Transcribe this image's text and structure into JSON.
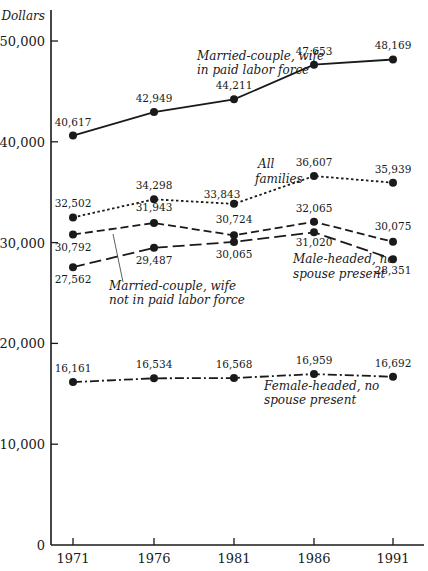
{
  "chart_data": {
    "type": "line",
    "title": "",
    "xlabel": "",
    "ylabel": "Dollars",
    "ylim": [
      0,
      52000
    ],
    "yticks": [
      0,
      10000,
      20000,
      30000,
      40000,
      50000
    ],
    "ytick_labels": [
      "0",
      "10,000",
      "20,000",
      "30,000",
      "40,000",
      "50,000"
    ],
    "categories": [
      "1971",
      "1976",
      "1981",
      "1986",
      "1991"
    ],
    "grid": false,
    "legend": "inline labels",
    "series": [
      {
        "name": "Married-couple, wife in paid labor force",
        "style": "solid",
        "values": [
          40617,
          42949,
          44211,
          47653,
          48169
        ],
        "labels": [
          "40,617",
          "42,949",
          "44,211",
          "47,653",
          "48,169"
        ]
      },
      {
        "name": "All families",
        "style": "dotted",
        "values": [
          32502,
          34298,
          33843,
          36607,
          35939
        ],
        "labels": [
          "32,502",
          "34,298",
          "33,843",
          "36,607",
          "35,939"
        ]
      },
      {
        "name": "Married-couple, wife not in paid labor force",
        "style": "dashed",
        "values": [
          30792,
          31943,
          30724,
          32065,
          30075
        ],
        "labels": [
          "30,792",
          "31,943",
          "30,724",
          "32,065",
          "30,075"
        ]
      },
      {
        "name": "Male-headed, no spouse present",
        "style": "long-dash",
        "values": [
          27562,
          29487,
          30065,
          31020,
          28351
        ],
        "labels": [
          "27,562",
          "29,487",
          "30,065",
          "31,020",
          "28,351"
        ]
      },
      {
        "name": "Female-headed, no spouse present",
        "style": "dash-dot",
        "values": [
          16161,
          16534,
          16568,
          16959,
          16692
        ],
        "labels": [
          "16,161",
          "16,534",
          "16,568",
          "16,959",
          "16,692"
        ]
      }
    ],
    "annotations": [
      {
        "series": 0,
        "lines": [
          "Married-couple, wife",
          "in paid labor force"
        ]
      },
      {
        "series": 1,
        "lines": [
          "All",
          "families"
        ]
      },
      {
        "series": 2,
        "lines": [
          "Married-couple, wife",
          "not in paid labor force"
        ]
      },
      {
        "series": 3,
        "lines": [
          "Male-headed, no",
          "spouse present"
        ]
      },
      {
        "series": 4,
        "lines": [
          "Female-headed, no",
          "spouse present"
        ]
      }
    ]
  }
}
